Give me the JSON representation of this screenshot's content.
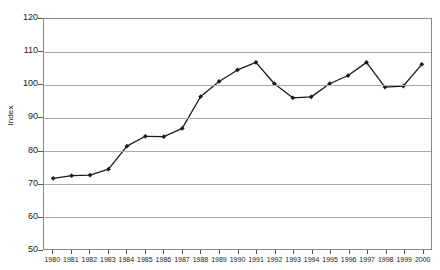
{
  "chart_data": {
    "type": "line",
    "title": "",
    "subtitle": "",
    "xlabel": "",
    "ylabel": "Index",
    "ylim": [
      50,
      120
    ],
    "ytick_step": 10,
    "yticks": [
      120,
      110,
      100,
      90,
      80,
      70,
      60,
      50
    ],
    "grid": true,
    "legend": false,
    "legend_position": "none",
    "marker": "diamond",
    "line_color": "#1a1a1a",
    "marker_color": "#1a1a1a",
    "gridline_color": "#a8a8a8",
    "frame_color": "#8a8a8a",
    "background": "#ffffff",
    "categories": [
      "1980",
      "1981",
      "1982",
      "1983",
      "1984",
      "1985",
      "1986",
      "1987",
      "1988",
      "1989",
      "1990",
      "1991",
      "1992",
      "1993",
      "1994",
      "1995",
      "1996",
      "1997",
      "1998",
      "1999",
      "2000"
    ],
    "series": [
      {
        "name": "Index",
        "values": [
          71.5,
          72.3,
          72.5,
          74.3,
          81.3,
          84.3,
          84.2,
          86.7,
          96.4,
          101.0,
          104.5,
          106.8,
          100.3,
          96.0,
          96.3,
          100.3,
          102.8,
          106.8,
          99.3,
          99.6,
          106.2
        ]
      }
    ]
  }
}
